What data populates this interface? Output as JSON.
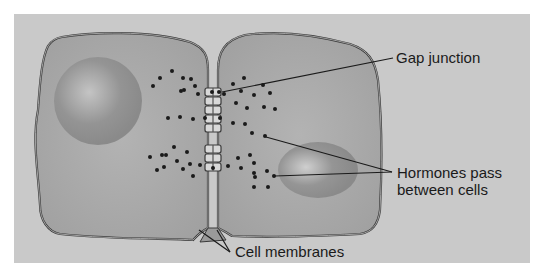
{
  "diagram": {
    "type": "biology-illustration",
    "labels": {
      "gap_junction": "Gap junction",
      "hormones_line1": "Hormones pass",
      "hormones_line2": "between cells",
      "cell_membranes": "Cell membranes"
    },
    "colors": {
      "background_panel": "#c9c9c9",
      "cell_fill": "#a9a9a9",
      "nucleus": "#8d8d8d",
      "outline": "#3a3a3a",
      "dots": "#1a1a1a",
      "text": "#1a1a1a"
    },
    "cells": [
      {
        "name": "left-cell",
        "has_nucleus": true
      },
      {
        "name": "right-cell",
        "has_nucleus": true
      }
    ]
  }
}
